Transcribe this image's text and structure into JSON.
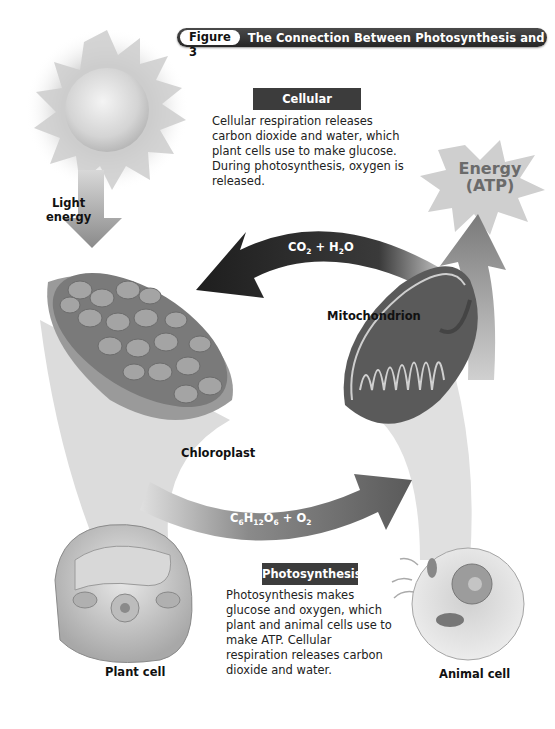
{
  "figure": {
    "number_label": "Figure 3",
    "title": "The Connection Between Photosynthesis and Respiration"
  },
  "cellular_respiration": {
    "heading": "Cellular respiration",
    "text": "Cellular respiration releases carbon dioxide and water, which plant cells use to make glucose. During photosynthesis, oxygen is released."
  },
  "photosynthesis": {
    "heading": "Photosynthesis",
    "text": "Photosynthesis makes glucose and oxygen, which plant and animal cells use to make ATP. Cellular respiration releases carbon dioxide and water."
  },
  "labels": {
    "light_energy_line1": "Light",
    "light_energy_line2": "energy",
    "energy_line1": "Energy",
    "energy_line2": "(ATP)",
    "mitochondrion": "Mitochondrion",
    "chloroplast": "Chloroplast",
    "plant_cell": "Plant cell",
    "animal_cell": "Animal cell"
  },
  "arrows": {
    "top_formula": {
      "a": "CO",
      "a_sub": "2",
      "plus": " + ",
      "b": "H",
      "b_sub": "2",
      "b_end": "O"
    },
    "bottom_formula": {
      "c": "C",
      "c_sub": "6",
      "h": "H",
      "h_sub": "12",
      "o": "O",
      "o_sub": "6",
      "plus": " + ",
      "o2": "O",
      "o2_sub": "2"
    }
  },
  "colors": {
    "header_bar": "#333333",
    "label_box": "#3c3c3c",
    "arrow_dark": "#2a2a2a",
    "cone_gray": "#d6d6d6"
  }
}
